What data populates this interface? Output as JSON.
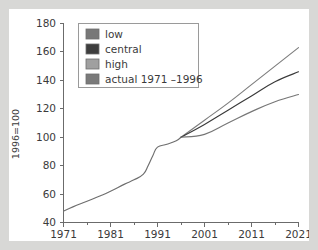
{
  "chart_data": {
    "type": "line",
    "title": "",
    "xlabel": "",
    "ylabel": "1996=100",
    "xlim": [
      1971,
      2021
    ],
    "ylim": [
      40,
      180
    ],
    "xticks": [
      1971,
      1981,
      1991,
      2001,
      2011,
      2021
    ],
    "xtick_labels": [
      "1971",
      "1981",
      "1991",
      "2001",
      "2011",
      "2021"
    ],
    "xminor_ticks": [
      1976,
      1986,
      1996,
      2006,
      2016
    ],
    "yticks": [
      40,
      60,
      80,
      100,
      120,
      140,
      160,
      180
    ],
    "ytick_labels": [
      "40",
      "60",
      "80",
      "100",
      "120",
      "140",
      "160",
      "180"
    ],
    "grid": false,
    "legend_position": "upper-left",
    "series": [
      {
        "name": "actual 1971 –1996",
        "color": "#6e6e6e",
        "x": [
          1971,
          1973,
          1976,
          1979,
          1981,
          1984,
          1986,
          1988,
          1989,
          1990,
          1991,
          1993,
          1995,
          1996
        ],
        "values": [
          48,
          51,
          55,
          59,
          62,
          67,
          70,
          74,
          80,
          87,
          93,
          95,
          97.5,
          100
        ]
      },
      {
        "name": "high",
        "color": "#7d7d7d",
        "x": [
          1996,
          2001,
          2006,
          2011,
          2016,
          2021
        ],
        "values": [
          100,
          112,
          124,
          137,
          150,
          163
        ]
      },
      {
        "name": "central",
        "color": "#3a3a3a",
        "x": [
          1996,
          2001,
          2006,
          2011,
          2016,
          2021
        ],
        "values": [
          100,
          109,
          119,
          129,
          139,
          146
        ]
      },
      {
        "name": "low",
        "color": "#767676",
        "x": [
          1996,
          2001,
          2006,
          2011,
          2016,
          2021
        ],
        "values": [
          100,
          102,
          110,
          118,
          125,
          130
        ]
      }
    ]
  },
  "legend": {
    "entries": [
      {
        "label": "low",
        "swatch_color": "#787878"
      },
      {
        "label": "central",
        "swatch_color": "#3d3d3d"
      },
      {
        "label": "high",
        "swatch_color": "#a0a0a0"
      },
      {
        "label": "actual 1971 –1996",
        "swatch_color": "#7a7a7a"
      }
    ]
  },
  "axes": {
    "y_axis_title": "1996=100",
    "y_tick_labels": [
      "180",
      "160",
      "140",
      "120",
      "100",
      "80",
      "60",
      "40"
    ],
    "x_tick_labels": [
      "1971",
      "1981",
      "1991",
      "2001",
      "2011",
      "2021"
    ]
  },
  "colors": {
    "page_background": "#d8d8d6",
    "figure_background": "#ffffff",
    "axis": "#6b6b6b",
    "text": "#3b3b3b"
  }
}
